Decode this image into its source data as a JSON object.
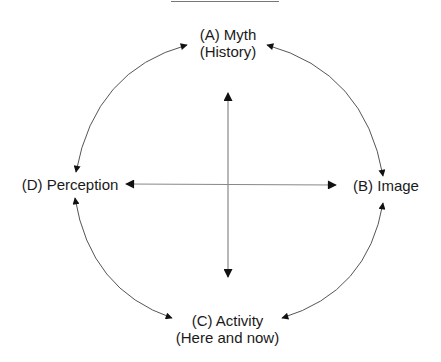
{
  "diagram": {
    "type": "circular relationship diagram",
    "top_rule": {
      "visible": true
    },
    "nodes": {
      "a": {
        "line1": "(A) Myth",
        "line2": "(History)"
      },
      "b": {
        "line1": "(B) Image"
      },
      "c": {
        "line1": "(C) Activity",
        "line2": "(Here and now)"
      },
      "d": {
        "line1": "(D) Perception"
      }
    },
    "connections": [
      {
        "from": "A",
        "to": "B",
        "style": "curved double-headed arrow"
      },
      {
        "from": "B",
        "to": "C",
        "style": "curved double-headed arrow"
      },
      {
        "from": "C",
        "to": "D",
        "style": "curved double-headed arrow"
      },
      {
        "from": "D",
        "to": "A",
        "style": "curved double-headed arrow"
      },
      {
        "from": "A",
        "to": "C",
        "style": "straight double-headed arrow (vertical)"
      },
      {
        "from": "D",
        "to": "B",
        "style": "straight double-headed arrow (horizontal)"
      }
    ],
    "colors": {
      "line": "#555555",
      "arrowhead": "#111111",
      "text": "#1a1a1a",
      "background": "#ffffff"
    }
  }
}
